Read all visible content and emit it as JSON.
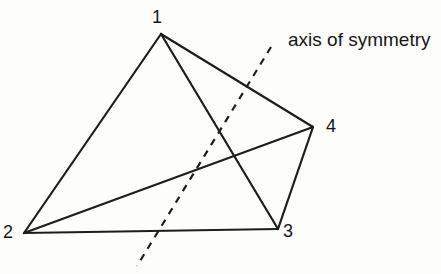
{
  "diagram": {
    "background_color": "#fdfdfc",
    "stroke_color": "#1d1d1d",
    "stroke_width": 2.2,
    "vertices": [
      {
        "id": "1",
        "label": "1",
        "x": 161,
        "y": 34,
        "label_x": 157,
        "label_y": 17
      },
      {
        "id": "2",
        "label": "2",
        "x": 24,
        "y": 233,
        "label_x": 8,
        "label_y": 232
      },
      {
        "id": "3",
        "label": "3",
        "x": 278,
        "y": 229,
        "label_x": 288,
        "label_y": 231
      },
      {
        "id": "4",
        "label": "4",
        "x": 313,
        "y": 127,
        "label_x": 331,
        "label_y": 126
      }
    ],
    "edges": [
      [
        "1",
        "2"
      ],
      [
        "2",
        "3"
      ],
      [
        "3",
        "4"
      ],
      [
        "4",
        "1"
      ],
      [
        "1",
        "3"
      ],
      [
        "2",
        "4"
      ]
    ],
    "axis_of_symmetry": {
      "label": "axis of symmetry",
      "label_x": 288,
      "label_y": 29,
      "x1": 271,
      "y1": 47,
      "x2": 137,
      "y2": 266,
      "dash_pattern": "7 6.5"
    }
  }
}
